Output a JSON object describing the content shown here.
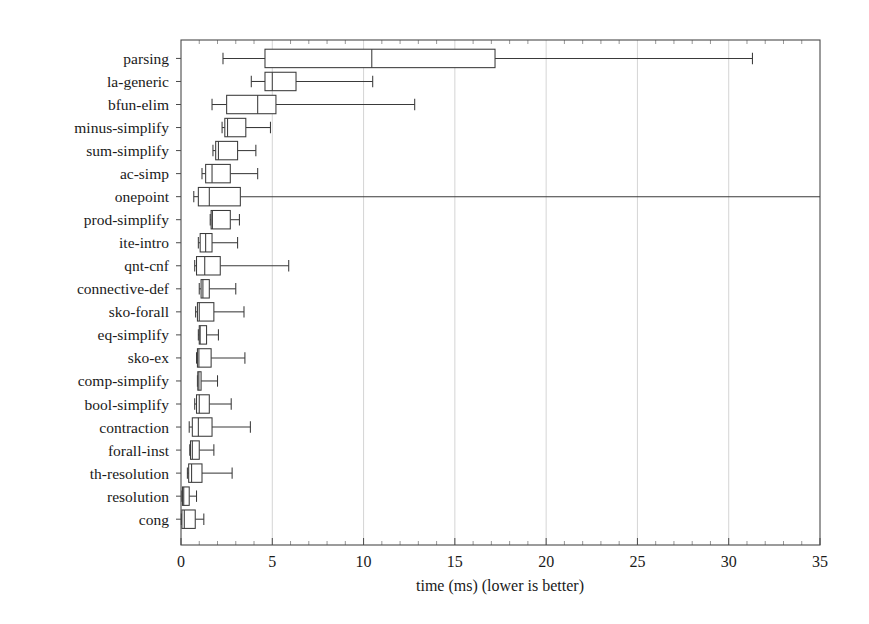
{
  "chart_data": {
    "type": "boxplot",
    "title": "",
    "subtitle": "",
    "xlabel": "time (ms) (lower is better)",
    "ylabel": "",
    "xlim": [
      0,
      35
    ],
    "xticks": [
      0,
      5,
      10,
      15,
      20,
      25,
      30,
      35
    ],
    "xtick_labels": [
      "0",
      "5",
      "10",
      "15",
      "20",
      "25",
      "30",
      "35"
    ],
    "minor_tick_step": 1,
    "grid": "vertical-major",
    "legend": "none",
    "orientation": "horizontal",
    "categories": [
      "parsing",
      "la-generic",
      "bfun-elim",
      "minus-simplify",
      "sum-simplify",
      "ac-simp",
      "onepoint",
      "prod-simplify",
      "ite-intro",
      "qnt-cnf",
      "connective-def",
      "sko-forall",
      "eq-simplify",
      "sko-ex",
      "comp-simplify",
      "bool-simplify",
      "contraction",
      "forall-inst",
      "th-resolution",
      "resolution",
      "cong"
    ],
    "boxes": [
      {
        "category": "parsing",
        "whisker_low": 2.3,
        "q1": 4.6,
        "median": 10.45,
        "q3": 17.2,
        "whisker_high": 31.3,
        "clipped_high": false
      },
      {
        "category": "la-generic",
        "whisker_low": 3.85,
        "q1": 4.6,
        "median": 5.0,
        "q3": 6.3,
        "whisker_high": 10.5,
        "clipped_high": false
      },
      {
        "category": "bfun-elim",
        "whisker_low": 1.7,
        "q1": 2.5,
        "median": 4.2,
        "q3": 5.2,
        "whisker_high": 12.8,
        "clipped_high": false
      },
      {
        "category": "minus-simplify",
        "whisker_low": 2.25,
        "q1": 2.4,
        "median": 2.55,
        "q3": 3.55,
        "whisker_high": 4.9,
        "clipped_high": false
      },
      {
        "category": "sum-simplify",
        "whisker_low": 1.75,
        "q1": 1.9,
        "median": 2.05,
        "q3": 3.1,
        "whisker_high": 4.1,
        "clipped_high": false
      },
      {
        "category": "ac-simp",
        "whisker_low": 1.15,
        "q1": 1.35,
        "median": 1.7,
        "q3": 2.7,
        "whisker_high": 4.2,
        "clipped_high": false
      },
      {
        "category": "onepoint",
        "whisker_low": 0.7,
        "q1": 0.95,
        "median": 1.55,
        "q3": 3.25,
        "whisker_high": 35.0,
        "clipped_high": true
      },
      {
        "category": "prod-simplify",
        "whisker_low": 1.6,
        "q1": 1.65,
        "median": 1.72,
        "q3": 2.7,
        "whisker_high": 3.2,
        "clipped_high": false
      },
      {
        "category": "ite-intro",
        "whisker_low": 0.95,
        "q1": 1.05,
        "median": 1.35,
        "q3": 1.7,
        "whisker_high": 3.1,
        "clipped_high": false
      },
      {
        "category": "qnt-cnf",
        "whisker_low": 0.75,
        "q1": 0.85,
        "median": 1.3,
        "q3": 2.15,
        "whisker_high": 5.9,
        "clipped_high": false
      },
      {
        "category": "connective-def",
        "whisker_low": 1.0,
        "q1": 1.1,
        "median": 1.2,
        "q3": 1.55,
        "whisker_high": 3.0,
        "clipped_high": false
      },
      {
        "category": "sko-forall",
        "whisker_low": 0.8,
        "q1": 0.9,
        "median": 1.0,
        "q3": 1.8,
        "whisker_high": 3.45,
        "clipped_high": false
      },
      {
        "category": "eq-simplify",
        "whisker_low": 0.95,
        "q1": 1.0,
        "median": 1.05,
        "q3": 1.4,
        "whisker_high": 2.05,
        "clipped_high": false
      },
      {
        "category": "sko-ex",
        "whisker_low": 0.85,
        "q1": 0.9,
        "median": 0.98,
        "q3": 1.65,
        "whisker_high": 3.5,
        "clipped_high": false
      },
      {
        "category": "comp-simplify",
        "whisker_low": 0.9,
        "q1": 0.92,
        "median": 0.98,
        "q3": 1.1,
        "whisker_high": 2.0,
        "clipped_high": false
      },
      {
        "category": "bool-simplify",
        "whisker_low": 0.75,
        "q1": 0.85,
        "median": 1.0,
        "q3": 1.55,
        "whisker_high": 2.75,
        "clipped_high": false
      },
      {
        "category": "contraction",
        "whisker_low": 0.45,
        "q1": 0.62,
        "median": 0.95,
        "q3": 1.7,
        "whisker_high": 3.8,
        "clipped_high": false
      },
      {
        "category": "forall-inst",
        "whisker_low": 0.48,
        "q1": 0.52,
        "median": 0.62,
        "q3": 1.0,
        "whisker_high": 1.8,
        "clipped_high": false
      },
      {
        "category": "th-resolution",
        "whisker_low": 0.35,
        "q1": 0.42,
        "median": 0.58,
        "q3": 1.15,
        "whisker_high": 2.8,
        "clipped_high": false
      },
      {
        "category": "resolution",
        "whisker_low": 0.05,
        "q1": 0.08,
        "median": 0.15,
        "q3": 0.45,
        "whisker_high": 0.85,
        "clipped_high": false
      },
      {
        "category": "cong",
        "whisker_low": 0.02,
        "q1": 0.05,
        "median": 0.18,
        "q3": 0.78,
        "whisker_high": 1.25,
        "clipped_high": false
      }
    ]
  },
  "axis": {
    "x_title": "time (ms) (lower is better)",
    "tick_0": "0",
    "tick_5": "5",
    "tick_10": "10",
    "tick_15": "15",
    "tick_20": "20",
    "tick_25": "25",
    "tick_30": "30",
    "tick_35": "35"
  },
  "style": {
    "line_color": "#3a3a3a",
    "frame_color": "#4a4a4a",
    "grid_color": "#c9c9c9",
    "box_fill": "#ffffff",
    "background": "#ffffff",
    "text_color": "#1a1a1a"
  }
}
